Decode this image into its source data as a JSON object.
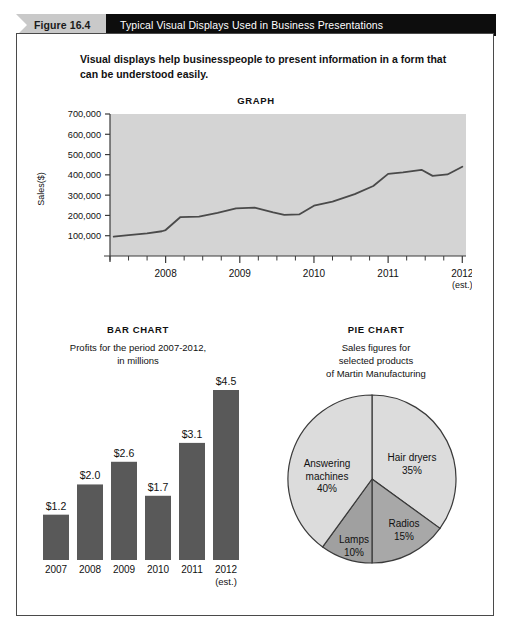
{
  "figure": {
    "number_label": "Figure 16.4",
    "title": "Typical Visual Displays Used in Business Presentations",
    "lead_text": "Visual displays help businesspeople to present information in a form that can be understood easily.",
    "header_pennant_color": "#c9c9c9",
    "header_bar_color": "#0d0d0d",
    "border_color": "#4a4a4a"
  },
  "chart_data": [
    {
      "type": "line",
      "title": "GRAPH",
      "xlabel": "",
      "ylabel": "Sales($)",
      "ylim": [
        0,
        700000
      ],
      "yticks": [
        "100,000",
        "200,000",
        "300,000",
        "400,000",
        "500,000",
        "600,000",
        "700,000"
      ],
      "ytick_values": [
        100000,
        200000,
        300000,
        400000,
        500000,
        600000,
        700000
      ],
      "xticks": [
        "2008",
        "2009",
        "2010",
        "2011",
        "2012"
      ],
      "xtick_sublabel": "(est.)",
      "grid": false,
      "plot_background": "#d4d4d4",
      "line_color": "#4a4a4a",
      "minor_ticks_per_year": 4,
      "x": [
        2007.3,
        2007.5,
        2007.75,
        2007.95,
        2008.0,
        2008.2,
        2008.45,
        2008.7,
        2008.95,
        2009.2,
        2009.45,
        2009.6,
        2009.8,
        2010.0,
        2010.25,
        2010.55,
        2010.8,
        2011.0,
        2011.2,
        2011.45,
        2011.6,
        2011.8,
        2012.0
      ],
      "values": [
        95000,
        103000,
        112000,
        122000,
        128000,
        192000,
        194000,
        212000,
        235000,
        238000,
        215000,
        203000,
        205000,
        248000,
        268000,
        305000,
        345000,
        405000,
        412000,
        425000,
        395000,
        402000,
        440000
      ]
    },
    {
      "type": "bar",
      "title": "BAR CHART",
      "caption": "Profits for the period 2007-2012,\nin millions",
      "categories": [
        "2007",
        "2008",
        "2009",
        "2010",
        "2011",
        "2012"
      ],
      "category_sublabel": "(est.)",
      "values": [
        1.2,
        2.0,
        2.6,
        1.7,
        3.1,
        4.5
      ],
      "data_labels": [
        "$1.2",
        "$2.0",
        "$2.6",
        "$1.7",
        "$3.1",
        "$4.5"
      ],
      "ylim": [
        0,
        4.5
      ],
      "xlabel": "",
      "ylabel": "",
      "grid": false,
      "bar_color": "#595959"
    },
    {
      "type": "pie",
      "title": "PIE CHART",
      "caption": "Sales figures for\nselected products\nof Martin Manufacturing",
      "labels": [
        "Hair dryers",
        "Radios",
        "Lamps",
        "Answering machines"
      ],
      "values": [
        35,
        15,
        10,
        40
      ],
      "value_labels": [
        "35%",
        "15%",
        "10%",
        "40%"
      ],
      "slice_colors": [
        "#dcdcdc",
        "#a8a8a8",
        "#a0a0a0",
        "#dcdcdc"
      ],
      "outline_color": "#3a3a3a",
      "legend_position": "inside-slices"
    }
  ]
}
